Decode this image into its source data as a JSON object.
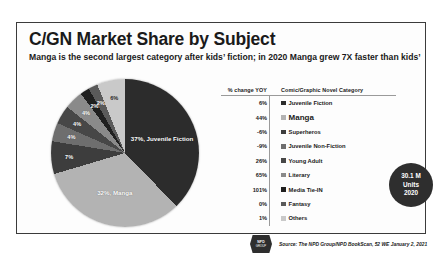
{
  "header": {
    "title": "C/GN Market Share by Subject",
    "subtitle": "Manga is the second largest category after kids’ fiction; in 2020 Manga grew 7X faster than kids’"
  },
  "table": {
    "col_pct": "% change YOY",
    "col_cat": "Comic/Graphic Novel Category"
  },
  "callout": {
    "value": "30.1 M",
    "units": "Units",
    "year": "2020"
  },
  "logo": {
    "line1": "NPD",
    "line2": "GROUP"
  },
  "footer": {
    "source": "Source: The NPD Group/NPD BookScan, 52 WE January 2, 2021"
  },
  "chart_data": {
    "type": "pie",
    "title": "C/GN Market Share by Subject",
    "legend_position": "right",
    "total_units": "30.1 M",
    "year": "2020",
    "categories": [
      "Juvenile Fiction",
      "Manga",
      "Superheros",
      "Juvenile Non-Fiction",
      "Young Adult",
      "Literary",
      "Media Tie-IN",
      "Fantasy",
      "Others"
    ],
    "values": [
      37,
      32,
      7,
      4,
      4,
      4,
      2,
      2,
      6
    ],
    "value_labels": [
      "37%, Juvenile Fiction",
      "32%, Manga",
      "7%",
      "4%",
      "4%",
      "4%",
      "2%",
      "2%",
      "6%"
    ],
    "pct_change_yoy": [
      "6%",
      "44%",
      "-6%",
      "-9%",
      "26%",
      "65%",
      "101%",
      "0%",
      "1%"
    ],
    "colors": [
      "#2c2c2c",
      "#b3b3b3",
      "#3d3d3d",
      "#6e6e6e",
      "#474747",
      "#8a8a8a",
      "#1f1f1f",
      "#5a5a5a",
      "#c9c9c9"
    ],
    "highlight": "Manga"
  }
}
